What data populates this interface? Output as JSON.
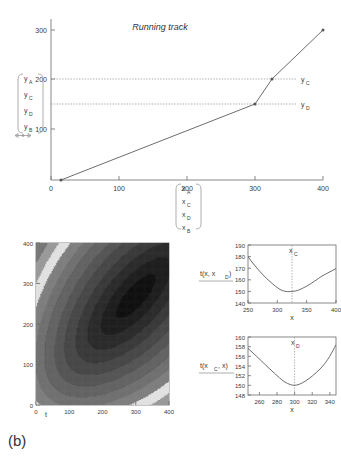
{
  "panel_label": "(b)",
  "top_chart": {
    "title": "Running track",
    "type": "line",
    "xlim": [
      0,
      420
    ],
    "ylim": [
      0,
      320
    ],
    "xticks": [
      0,
      100,
      200,
      300,
      400
    ],
    "yticks": [
      100,
      200,
      300
    ],
    "x": [
      15,
      300,
      325,
      400
    ],
    "y": [
      0,
      150,
      200,
      300
    ],
    "xlabel": "",
    "ylabel": "",
    "grid": false,
    "legend": "none",
    "hlines": [
      {
        "value": 200,
        "label": "y_C",
        "label_text": "y",
        "label_sub": "C"
      },
      {
        "value": 150,
        "label": "y_D",
        "label_text": "y",
        "label_sub": "D"
      }
    ],
    "right_labels": [
      {
        "text": "y",
        "sub": "C",
        "value": 200
      },
      {
        "text": "y",
        "sub": "D",
        "value": 150
      }
    ],
    "y_bracket": [
      {
        "text": "y",
        "sub": "A"
      },
      {
        "text": "y",
        "sub": "C"
      },
      {
        "text": "y",
        "sub": "D"
      },
      {
        "text": "y",
        "sub": "B"
      }
    ],
    "x_bracket": [
      {
        "text": "x",
        "sub": "A"
      },
      {
        "text": "x",
        "sub": "C"
      },
      {
        "text": "x",
        "sub": "D"
      },
      {
        "text": "x",
        "sub": "B"
      }
    ]
  },
  "contour_chart": {
    "type": "heatmap",
    "xlabel": "t",
    "ylabel": "",
    "xlim": [
      0,
      400
    ],
    "ylim": [
      0,
      400
    ],
    "xticks": [
      0,
      100,
      200,
      300,
      400
    ],
    "yticks": [
      0,
      100,
      200,
      300,
      400
    ],
    "minimum": {
      "t": 300,
      "x": 270
    },
    "levels": 12,
    "colormap": "grayscale-dark-minimum"
  },
  "profile_top": {
    "type": "line",
    "ylabel_text": "t(x, x",
    "ylabel_sub": "D",
    "ylabel_close": ")",
    "xlabel": "x",
    "xlim": [
      250,
      400
    ],
    "ylim": [
      140,
      190
    ],
    "xticks": [
      250,
      300,
      350,
      400
    ],
    "yticks": [
      140,
      150,
      160,
      170,
      180,
      190
    ],
    "marker_text": "x",
    "marker_sub": "C",
    "marker_x": 325,
    "minimum_y": 150,
    "x": [
      250,
      270,
      290,
      310,
      325,
      340,
      360,
      380,
      400
    ],
    "y": [
      180,
      167,
      157.5,
      151.5,
      150,
      151.2,
      155.5,
      161,
      167.5
    ],
    "grid": false
  },
  "profile_bottom": {
    "type": "line",
    "ylabel_text": "t(x",
    "ylabel_sub": "C",
    "ylabel_close": ", x)",
    "xlabel": "x",
    "xlim": [
      247,
      347
    ],
    "ylim": [
      148,
      160
    ],
    "xticks": [
      260,
      280,
      300,
      320,
      340
    ],
    "yticks": [
      148,
      150,
      152,
      154,
      156,
      158,
      160
    ],
    "marker_text": "x",
    "marker_sub": "D",
    "marker_x": 300,
    "minimum_y": 150,
    "x": [
      247,
      255,
      265,
      275,
      285,
      295,
      300,
      310,
      320,
      330,
      340,
      347
    ],
    "y": [
      157.7,
      155.6,
      153.4,
      151.8,
      150.6,
      150.05,
      150,
      150.7,
      152.2,
      154.2,
      156.7,
      158.6
    ],
    "grid": false
  },
  "chart_data": [
    {
      "type": "line",
      "title": "Running track",
      "xlabel": "",
      "ylabel": "",
      "x": [
        15,
        300,
        325,
        400
      ],
      "y": [
        0,
        150,
        200,
        300
      ],
      "xlim": [
        0,
        420
      ],
      "ylim": [
        0,
        320
      ],
      "xticks": [
        0,
        100,
        200,
        300,
        400
      ],
      "yticks": [
        100,
        200,
        300
      ],
      "annotations": [
        "y_A",
        "y_C",
        "y_D",
        "y_B",
        "x_A",
        "x_C",
        "x_D",
        "x_B"
      ],
      "grid": false,
      "legend": "none"
    },
    {
      "type": "heatmap",
      "title": "",
      "xlabel": "t",
      "ylabel": "x",
      "xlim": [
        0,
        400
      ],
      "ylim": [
        0,
        400
      ],
      "xticks": [
        0,
        100,
        200,
        300,
        400
      ],
      "yticks": [
        0,
        100,
        200,
        300,
        400
      ],
      "minimum": [
        300,
        270
      ],
      "grid": false,
      "legend": "none"
    },
    {
      "type": "line",
      "title": "",
      "xlabel": "x",
      "ylabel": "t(x, x_D)",
      "x": [
        250,
        270,
        290,
        310,
        325,
        340,
        360,
        380,
        400
      ],
      "y": [
        180,
        167,
        157.5,
        151.5,
        150,
        151.2,
        155.5,
        161,
        167.5
      ],
      "xlim": [
        250,
        400
      ],
      "ylim": [
        140,
        190
      ],
      "xticks": [
        250,
        300,
        350,
        400
      ],
      "yticks": [
        140,
        150,
        160,
        170,
        180,
        190
      ],
      "annotations": [
        "x_C at 325"
      ],
      "grid": false,
      "legend": "none"
    },
    {
      "type": "line",
      "title": "",
      "xlabel": "x",
      "ylabel": "t(x_C, x)",
      "x": [
        247,
        255,
        265,
        275,
        285,
        295,
        300,
        310,
        320,
        330,
        340,
        347
      ],
      "y": [
        157.7,
        155.6,
        153.4,
        151.8,
        150.6,
        150.05,
        150,
        150.7,
        152.2,
        154.2,
        156.7,
        158.6
      ],
      "xlim": [
        247,
        347
      ],
      "ylim": [
        148,
        160
      ],
      "xticks": [
        260,
        280,
        300,
        320,
        340
      ],
      "yticks": [
        148,
        150,
        152,
        154,
        156,
        158,
        160
      ],
      "annotations": [
        "x_D at 300"
      ],
      "grid": false,
      "legend": "none"
    }
  ]
}
